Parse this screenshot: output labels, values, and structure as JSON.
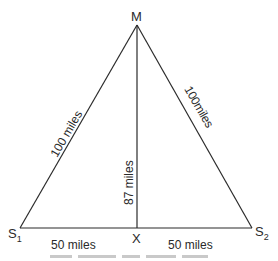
{
  "diagram": {
    "type": "triangle",
    "vertices": {
      "top": {
        "label": "M",
        "x": 137,
        "y": 25
      },
      "left": {
        "label": "S",
        "sub": "1",
        "x": 20,
        "y": 228
      },
      "right": {
        "label": "S",
        "sub": "2",
        "x": 252,
        "y": 228
      },
      "foot": {
        "label": "X",
        "x": 137,
        "y": 228
      }
    },
    "edges": {
      "left_side": "100 miles",
      "right_side": "100miles",
      "altitude": "87 miles",
      "base_left": "50 miles",
      "base_right": "50 miles"
    },
    "colors": {
      "line": "#2b2b2b",
      "text": "#2a2a2a",
      "background": "#ffffff"
    }
  }
}
